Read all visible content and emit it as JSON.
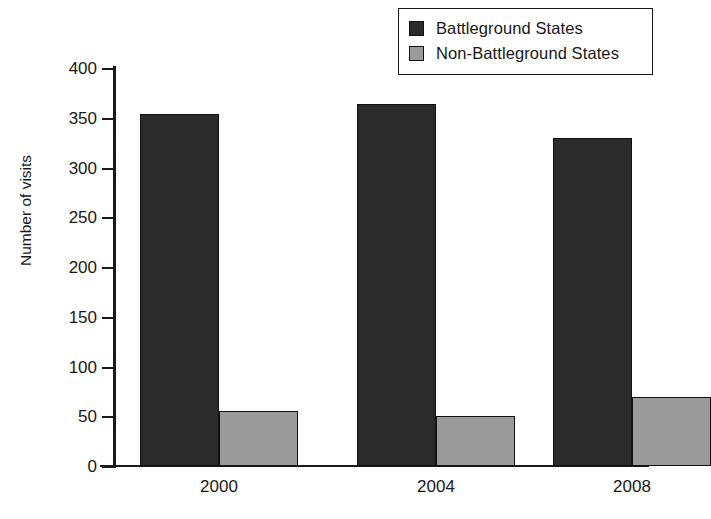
{
  "chart_data": {
    "type": "bar",
    "title": "",
    "subtitle": "",
    "xlabel": "",
    "ylabel": "Number of visits",
    "categories": [
      "2000",
      "2004",
      "2008"
    ],
    "series": [
      {
        "name": "Battleground States",
        "values": [
          354,
          364,
          330
        ],
        "color": "#2b2b2b"
      },
      {
        "name": "Non-Battleground States",
        "values": [
          55,
          50,
          69
        ],
        "color": "#9a9a9a"
      }
    ],
    "ylim": [
      0,
      400
    ],
    "yticks": [
      0,
      50,
      100,
      150,
      200,
      250,
      300,
      350,
      400
    ],
    "ytick_labels": [
      "0",
      "50",
      "100",
      "150",
      "200",
      "250",
      "300",
      "350",
      "400"
    ],
    "grid": false,
    "legend_position": "top-right",
    "annotations": []
  },
  "legend": {
    "entries": [
      {
        "label": "Battleground States",
        "swatch_color": "#2b2b2b",
        "icon": "legend-swatch-icon"
      },
      {
        "label": "Non-Battleground States",
        "swatch_color": "#9a9a9a",
        "icon": "legend-swatch-icon"
      }
    ]
  },
  "axes": {
    "y_title": "Number of visits",
    "y_tick_labels": [
      "400",
      "350",
      "300",
      "250",
      "200",
      "150",
      "100",
      "50",
      "0"
    ],
    "x_tick_labels": [
      "2000",
      "2004",
      "2008"
    ]
  }
}
